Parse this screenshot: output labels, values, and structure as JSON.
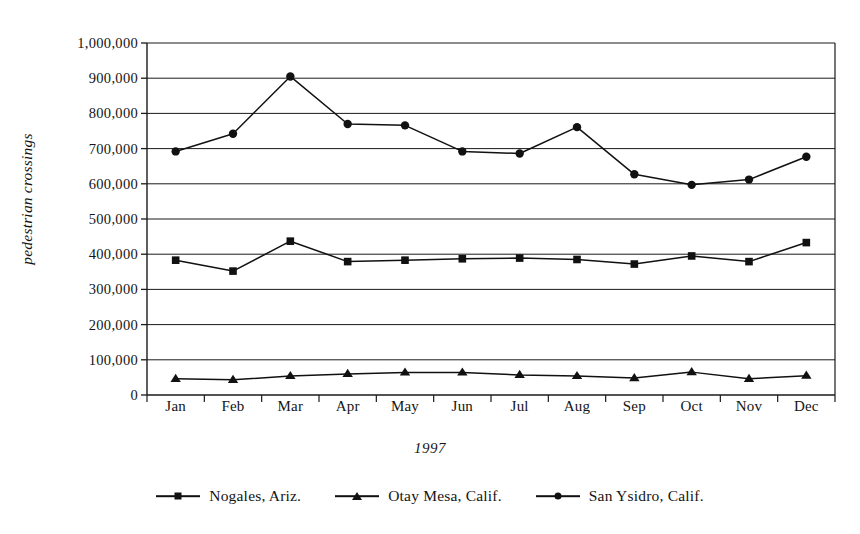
{
  "chart_data": {
    "type": "line",
    "title": "",
    "xlabel": "1997",
    "ylabel": "pedestrian crossings",
    "categories": [
      "Jan",
      "Feb",
      "Mar",
      "Apr",
      "May",
      "Jun",
      "Jul",
      "Aug",
      "Sep",
      "Oct",
      "Nov",
      "Dec"
    ],
    "ylim": [
      0,
      1000000
    ],
    "ytick_values": [
      0,
      100000,
      200000,
      300000,
      400000,
      500000,
      600000,
      700000,
      800000,
      900000,
      1000000
    ],
    "ytick_labels": [
      "0",
      "100,000",
      "200,000",
      "300,000",
      "400,000",
      "500,000",
      "600,000",
      "700,000",
      "800,000",
      "900,000",
      "1,000,000"
    ],
    "grid": true,
    "legend_position": "bottom",
    "series": [
      {
        "name": "Nogales, Ariz.",
        "marker": "square",
        "color": "#111111",
        "values": [
          383000,
          352000,
          437000,
          379000,
          383000,
          387000,
          389000,
          385000,
          372000,
          395000,
          379000,
          433000
        ]
      },
      {
        "name": "Otay Mesa, Calif.",
        "marker": "triangle",
        "color": "#111111",
        "values": [
          46000,
          43000,
          54000,
          60000,
          64000,
          64000,
          57000,
          54000,
          48000,
          65000,
          46000,
          55000
        ]
      },
      {
        "name": "San Ysidro, Calif.",
        "marker": "circle",
        "color": "#111111",
        "values": [
          692000,
          742000,
          905000,
          770000,
          766000,
          692000,
          686000,
          761000,
          627000,
          597000,
          612000,
          677000
        ]
      }
    ]
  },
  "axis": {
    "y_title": "pedestrian crossings",
    "x_title": "1997"
  }
}
